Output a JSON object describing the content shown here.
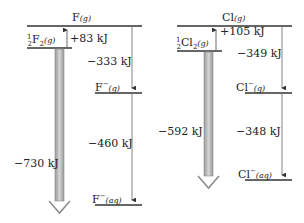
{
  "left_panel": {
    "species": {
      "top": "F",
      "top_state": "(g)",
      "elem_coef_top": "1",
      "elem_coef_bot": "2",
      "elem": "F",
      "elem_sub": "2",
      "elem_state": "(g)",
      "ion_g": "F",
      "ion_g_charge": "−",
      "ion_g_state": "(g)",
      "ion_aq": "F",
      "ion_aq_charge": "−",
      "ion_aq_state": "(aq)"
    },
    "energies": {
      "step1": "+83  kJ",
      "step2": "−333  kJ",
      "step3": "−460  kJ",
      "overall": "−730  kJ"
    }
  },
  "right_panel": {
    "species": {
      "top": "Cl",
      "top_state": "(g)",
      "elem_coef_top": "1",
      "elem_coef_bot": "2",
      "elem": "Cl",
      "elem_sub": "2",
      "elem_state": "(g)",
      "ion_g": "Cl",
      "ion_g_charge": "−",
      "ion_g_state": "(g)",
      "ion_aq": "Cl",
      "ion_aq_charge": "−",
      "ion_aq_state": "(aq)"
    },
    "energies": {
      "step1": "+105  kJ",
      "step2": "−349  kJ",
      "step3": "−348  kJ",
      "overall": "−592  kJ"
    }
  },
  "colors": {
    "level_line": "#333333",
    "step_arrow": "#555555",
    "overall_arrow_fill": "#bdbdbd",
    "overall_arrow_edge": "#8a8a8a"
  }
}
